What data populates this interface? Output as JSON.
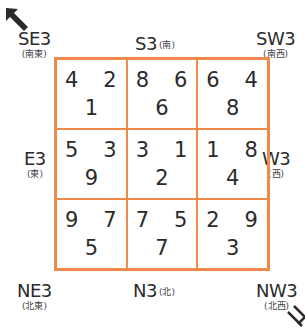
{
  "directions": {
    "se": {
      "main": "SE3",
      "sub": "(南東)"
    },
    "s": {
      "main": "S3",
      "sub": "(南)"
    },
    "sw": {
      "main": "SW3",
      "sub": "(南西)"
    },
    "e": {
      "main": "E3",
      "sub": "(東)"
    },
    "w": {
      "main": "W3",
      "sub": "(西)"
    },
    "ne": {
      "main": "NE3",
      "sub": "(北東)"
    },
    "n": {
      "main": "N3",
      "sub": "(北)"
    },
    "nw": {
      "main": "NW3",
      "sub": "(北西)"
    }
  },
  "grid": {
    "border_color": "#f08a4b",
    "cells": [
      {
        "tl": "4",
        "tr": "2",
        "bc": "1"
      },
      {
        "tl": "8",
        "tr": "6",
        "bc": "6"
      },
      {
        "tl": "6",
        "tr": "4",
        "bc": "8"
      },
      {
        "tl": "5",
        "tr": "3",
        "bc": "9"
      },
      {
        "tl": "3",
        "tr": "1",
        "bc": "2"
      },
      {
        "tl": "1",
        "tr": "8",
        "bc": "4"
      },
      {
        "tl": "9",
        "tr": "7",
        "bc": "5"
      },
      {
        "tl": "7",
        "tr": "5",
        "bc": "7"
      },
      {
        "tl": "2",
        "tr": "9",
        "bc": "3"
      }
    ]
  },
  "icons": {
    "top_left": "arrow-up-left-solid",
    "bottom_right": "arrow-down-right-outline"
  }
}
